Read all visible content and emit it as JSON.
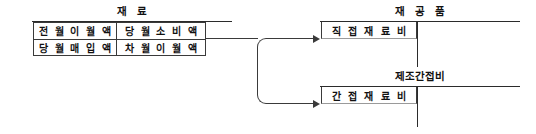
{
  "diagram": {
    "title_left": "재 료",
    "accounts": {
      "material": {
        "name": "재 료",
        "rows": [
          {
            "debit": "전 월 이 월 액",
            "credit": "당 월 소 비 액"
          },
          {
            "debit": "당 월 매 입 액",
            "credit": "차 월 이 월 액"
          }
        ]
      },
      "wip": {
        "name": "재 공 품",
        "entry": "직 접 재 료 비"
      },
      "overhead": {
        "name": "제조간접비",
        "entry": "간 접 재 료 비"
      }
    },
    "flows": [
      {
        "from": "당 월 소 비 액",
        "to": "직 접 재 료 비"
      },
      {
        "from": "당 월 소 비 액",
        "to": "간 접 재 료 비"
      }
    ],
    "colors": {
      "line": "#2b2b2b",
      "text": "#111111",
      "background": "#ffffff"
    }
  }
}
